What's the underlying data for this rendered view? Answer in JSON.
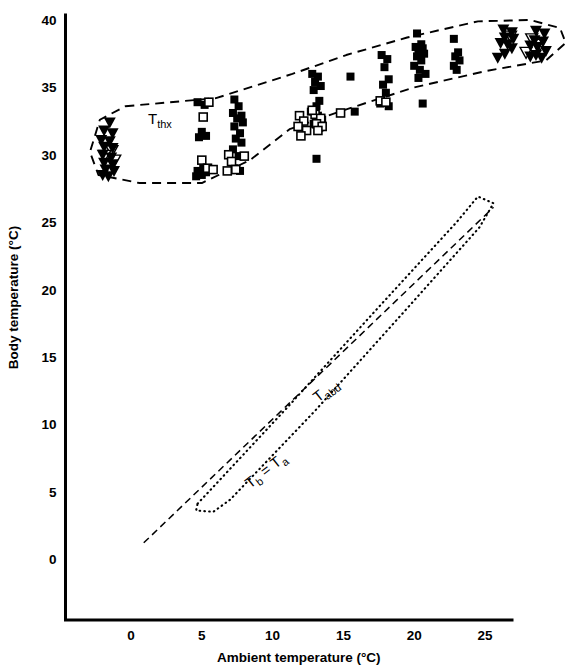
{
  "chart_data": {
    "type": "scatter",
    "title": "",
    "xlabel": "Ambient temperature (°C)",
    "ylabel": "Body temperature (°C)",
    "xlim": [
      -3.5,
      31.5
    ],
    "ylim": [
      -5.5,
      41.5
    ],
    "xticks": [
      0,
      5,
      10,
      15,
      20,
      25
    ],
    "xtick_labels": [
      "0",
      "5",
      "10",
      "15",
      "20",
      "25"
    ],
    "yticks": [
      0,
      5,
      10,
      15,
      20,
      25,
      30,
      35,
      40
    ],
    "ytick_labels": [
      "0",
      "5",
      "10",
      "15",
      "20",
      "25",
      "30",
      "35",
      "40"
    ],
    "grid": false,
    "legend": "none",
    "annotations": [
      {
        "name": "thorax-envelope-label",
        "text": "T",
        "subscript": "thx",
        "x": 1.2,
        "y": 32.3,
        "rotation": 0
      },
      {
        "name": "abdomen-envelope-label",
        "text": "T",
        "subscript": "abd",
        "x": 13.2,
        "y": 11.6,
        "rotation": -38
      },
      {
        "name": "identity-line-label",
        "text": "T",
        "subscript": "b",
        "text2": " = T",
        "subscript2": "a",
        "x": 8.4,
        "y": 5.2,
        "rotation": -38
      }
    ],
    "series": [
      {
        "name": "Thorax temperature (open triangles)",
        "symbol": "triangle-down-open",
        "points": [
          [
            -1.35,
            30.3
          ],
          [
            -1.85,
            29.95
          ],
          [
            -1.15,
            29.6
          ],
          [
            26.8,
            38.8
          ],
          [
            28.3,
            38.6
          ],
          [
            28.9,
            38.2
          ],
          [
            27.9,
            37.6
          ]
        ]
      },
      {
        "name": "Thorax temperature (filled triangles)",
        "symbol": "triangle-down-filled",
        "points": [
          [
            -1.5,
            32.4
          ],
          [
            -1.9,
            31.8
          ],
          [
            -1.3,
            31.6
          ],
          [
            -2.1,
            31.1
          ],
          [
            -1.5,
            31.0
          ],
          [
            -1.9,
            30.6
          ],
          [
            -1.3,
            30.5
          ],
          [
            -2.0,
            30.0
          ],
          [
            -1.4,
            29.8
          ],
          [
            -1.9,
            29.4
          ],
          [
            -1.3,
            29.3
          ],
          [
            -1.8,
            28.9
          ],
          [
            -1.2,
            28.8
          ],
          [
            -1.6,
            28.4
          ],
          [
            -2.0,
            28.5
          ],
          [
            26.3,
            39.3
          ],
          [
            26.9,
            39.1
          ],
          [
            26.4,
            38.7
          ],
          [
            27.0,
            38.6
          ],
          [
            26.6,
            38.2
          ],
          [
            26.1,
            38.3
          ],
          [
            26.9,
            37.9
          ],
          [
            26.4,
            37.5
          ],
          [
            25.9,
            37.2
          ],
          [
            28.6,
            39.2
          ],
          [
            29.2,
            39.0
          ],
          [
            28.5,
            38.5
          ],
          [
            29.1,
            38.4
          ],
          [
            28.7,
            38.0
          ],
          [
            28.2,
            38.1
          ],
          [
            29.3,
            37.7
          ],
          [
            28.6,
            37.4
          ],
          [
            29.0,
            37.2
          ],
          [
            28.2,
            37.3
          ]
        ]
      },
      {
        "name": "Thorax temperature (filled squares)",
        "symbol": "square-filled",
        "points": [
          [
            4.7,
            33.9
          ],
          [
            5.2,
            33.7
          ],
          [
            5.0,
            31.7
          ],
          [
            5.3,
            31.4
          ],
          [
            4.8,
            31.3
          ],
          [
            5.1,
            29.0
          ],
          [
            4.7,
            28.8
          ],
          [
            5.3,
            28.7
          ],
          [
            5.0,
            28.5
          ],
          [
            4.6,
            28.4
          ],
          [
            7.3,
            34.1
          ],
          [
            7.6,
            33.6
          ],
          [
            7.2,
            33.1
          ],
          [
            7.8,
            32.9
          ],
          [
            7.5,
            32.7
          ],
          [
            7.9,
            32.4
          ],
          [
            7.3,
            32.1
          ],
          [
            7.7,
            31.6
          ],
          [
            7.4,
            31.2
          ],
          [
            7.8,
            30.9
          ],
          [
            7.2,
            30.4
          ],
          [
            7.6,
            29.9
          ],
          [
            7.3,
            29.0
          ],
          [
            7.7,
            28.8
          ],
          [
            12.8,
            36.0
          ],
          [
            13.2,
            35.8
          ],
          [
            13.0,
            35.4
          ],
          [
            13.4,
            35.1
          ],
          [
            12.9,
            34.8
          ],
          [
            13.3,
            34.0
          ],
          [
            13.1,
            33.6
          ],
          [
            12.7,
            33.2
          ],
          [
            13.2,
            32.9
          ],
          [
            13.5,
            32.6
          ],
          [
            12.9,
            32.3
          ],
          [
            13.3,
            32.0
          ],
          [
            13.1,
            29.7
          ],
          [
            15.5,
            35.8
          ],
          [
            15.8,
            33.2
          ],
          [
            17.7,
            37.4
          ],
          [
            18.1,
            37.1
          ],
          [
            17.9,
            36.5
          ],
          [
            18.2,
            35.6
          ],
          [
            17.8,
            35.2
          ],
          [
            18.0,
            34.6
          ],
          [
            17.6,
            33.8
          ],
          [
            18.2,
            33.6
          ],
          [
            20.2,
            39.0
          ],
          [
            20.5,
            38.2
          ],
          [
            20.1,
            38.0
          ],
          [
            20.6,
            37.9
          ],
          [
            20.3,
            37.7
          ],
          [
            20.7,
            37.5
          ],
          [
            20.2,
            37.3
          ],
          [
            20.5,
            37.0
          ],
          [
            20.0,
            36.6
          ],
          [
            20.4,
            36.3
          ],
          [
            20.8,
            36.0
          ],
          [
            20.3,
            35.7
          ],
          [
            20.6,
            33.8
          ],
          [
            22.8,
            38.6
          ],
          [
            23.1,
            37.6
          ],
          [
            22.9,
            37.3
          ],
          [
            23.2,
            37.0
          ],
          [
            22.8,
            36.6
          ],
          [
            23.0,
            36.3
          ]
        ]
      },
      {
        "name": "Abdomen temperature (open squares)",
        "symbol": "square-open",
        "points": [
          [
            5.5,
            33.9
          ],
          [
            5.1,
            32.8
          ],
          [
            5.0,
            29.6
          ],
          [
            5.4,
            29.0
          ],
          [
            5.8,
            28.9
          ],
          [
            6.9,
            30.0
          ],
          [
            7.1,
            29.5
          ],
          [
            7.4,
            28.9
          ],
          [
            6.8,
            28.8
          ],
          [
            8.0,
            29.9
          ],
          [
            11.9,
            32.9
          ],
          [
            12.2,
            32.5
          ],
          [
            11.8,
            32.1
          ],
          [
            12.4,
            31.8
          ],
          [
            12.0,
            31.4
          ],
          [
            13.0,
            33.0
          ],
          [
            13.4,
            32.7
          ],
          [
            13.1,
            32.3
          ],
          [
            13.5,
            32.1
          ],
          [
            13.2,
            31.8
          ],
          [
            12.8,
            33.3
          ],
          [
            14.8,
            33.1
          ],
          [
            17.6,
            34.0
          ],
          [
            18.0,
            33.9
          ]
        ]
      }
    ],
    "envelopes": [
      {
        "name": "thorax-envelope",
        "style": "dashed",
        "label": "T_thx",
        "vertices": [
          [
            -0.4,
            33.6
          ],
          [
            6.0,
            34.2
          ],
          [
            11.4,
            36.0
          ],
          [
            15.2,
            37.4
          ],
          [
            19.5,
            38.7
          ],
          [
            24.5,
            39.9
          ],
          [
            28.2,
            40.0
          ],
          [
            30.3,
            39.4
          ],
          [
            30.7,
            38.3
          ],
          [
            29.3,
            37.0
          ],
          [
            25.0,
            36.2
          ],
          [
            20.0,
            35.0
          ],
          [
            15.0,
            33.3
          ],
          [
            11.2,
            31.9
          ],
          [
            8.4,
            29.6
          ],
          [
            5.0,
            27.9
          ],
          [
            0.6,
            27.9
          ],
          [
            -2.3,
            28.5
          ],
          [
            -2.9,
            30.2
          ],
          [
            -2.2,
            32.6
          ]
        ]
      },
      {
        "name": "abdomen-envelope",
        "style": "dotted",
        "label": "T_abd",
        "vertices": [
          [
            4.7,
            4.1
          ],
          [
            11.0,
            11.2
          ],
          [
            17.5,
            18.7
          ],
          [
            23.0,
            25.0
          ],
          [
            24.5,
            26.9
          ],
          [
            25.6,
            26.4
          ],
          [
            24.6,
            24.6
          ],
          [
            19.5,
            18.6
          ],
          [
            13.0,
            11.0
          ],
          [
            7.0,
            4.4
          ],
          [
            5.8,
            3.5
          ],
          [
            4.6,
            3.6
          ]
        ]
      }
    ],
    "reference_line": {
      "name": "identity-line",
      "label": "Tb = Ta",
      "style": "dash",
      "from": [
        0.9,
        1.2
      ],
      "to": [
        25.6,
        26.1
      ]
    }
  }
}
